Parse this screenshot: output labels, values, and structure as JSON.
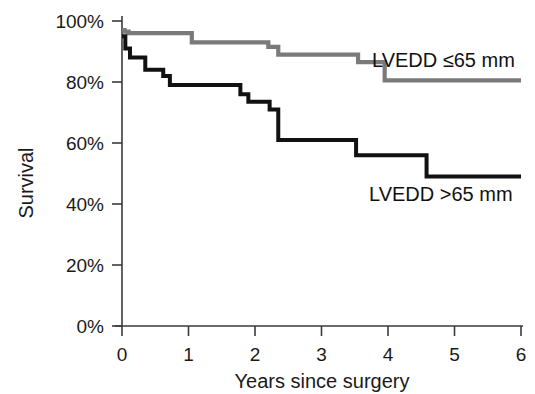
{
  "chart_data": {
    "type": "line",
    "subtype": "kaplan-meier-step",
    "title": "",
    "xlabel": "Years since surgery",
    "ylabel": "Survival",
    "xlim": [
      0,
      6
    ],
    "ylim": [
      0,
      100
    ],
    "grid": false,
    "legend_position": "inline-annotation",
    "xticks": [
      0,
      1,
      2,
      3,
      4,
      5,
      6
    ],
    "xtick_labels": [
      "0",
      "1",
      "2",
      "3",
      "4",
      "5",
      "6"
    ],
    "yticks": [
      0,
      20,
      40,
      60,
      80,
      100
    ],
    "ytick_labels": [
      "0%",
      "20%",
      "40%",
      "60%",
      "80%",
      "100%"
    ],
    "series": [
      {
        "name": "LVEDD  ≤65 mm",
        "color": "#7a7a7a",
        "annotation": "LVEDD  ≤65 mm",
        "x": [
          0.0,
          0.04,
          0.1,
          0.95,
          1.05,
          1.95,
          2.2,
          2.35,
          3.45,
          3.55,
          3.8,
          3.95,
          6.0
        ],
        "y": [
          97.0,
          96.5,
          96.0,
          96.0,
          93.0,
          93.0,
          91.5,
          89.0,
          89.0,
          86.5,
          86.5,
          80.5,
          80.5
        ]
      },
      {
        "name": "LVEDD >65 mm",
        "color": "#111111",
        "annotation": "LVEDD >65 mm",
        "x": [
          0.0,
          0.05,
          0.12,
          0.22,
          0.35,
          0.5,
          0.62,
          0.72,
          1.68,
          1.78,
          1.9,
          2.05,
          2.22,
          2.35,
          3.38,
          3.52,
          4.45,
          4.58,
          6.0
        ],
        "y": [
          95.0,
          91.0,
          88.0,
          88.0,
          84.0,
          84.0,
          82.0,
          79.0,
          79.0,
          76.0,
          73.5,
          73.5,
          71.0,
          61.0,
          61.0,
          56.0,
          56.0,
          49.0,
          49.0
        ]
      }
    ]
  },
  "axes": {
    "y_title": "Survival",
    "x_title": "Years since surgery"
  },
  "annotations": {
    "upper_series_label": "LVEDD  ≤65 mm",
    "lower_series_label": "LVEDD >65 mm"
  },
  "colors": {
    "upper_series": "#7a7a7a",
    "lower_series": "#111111",
    "axis": "#3a3a3a",
    "text": "#1a1a1a",
    "background": "#ffffff"
  }
}
